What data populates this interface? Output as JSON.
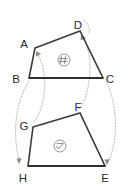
{
  "diagram": {
    "kind": "geometry-transformation-diagram",
    "background_color": "#ffffff",
    "stroke_color": "#3a3a3a",
    "arrow_color": "#b9b4ad",
    "label_color": "#2b2b2b",
    "marker_color": "#8a8a8a"
  },
  "shapes": [
    {
      "id": "upper-quadrilateral",
      "name": "ABCD",
      "vertex_order": [
        "A",
        "D",
        "C",
        "B"
      ],
      "marker": {
        "glyph": "hash-mark",
        "cx": 64,
        "cy": 60,
        "r": 6
      },
      "vertices": [
        {
          "label": "A",
          "x": 35,
          "y": 48,
          "label_x": 24,
          "label_y": 44
        },
        {
          "label": "D",
          "x": 80,
          "y": 31,
          "label_x": 76,
          "label_y": 25
        },
        {
          "label": "C",
          "x": 103,
          "y": 78,
          "label_x": 107,
          "label_y": 83
        },
        {
          "label": "B",
          "x": 29,
          "y": 78,
          "label_x": 14,
          "label_y": 81
        }
      ]
    },
    {
      "id": "lower-quadrilateral",
      "name": "GFEH",
      "vertex_order": [
        "G",
        "F",
        "E",
        "H"
      ],
      "marker": {
        "glyph": "check-mark",
        "cx": 60,
        "cy": 146,
        "r": 6
      },
      "vertices": [
        {
          "label": "G",
          "x": 33,
          "y": 127,
          "label_x": 20,
          "label_y": 126
        },
        {
          "label": "F",
          "x": 80,
          "y": 113,
          "label_x": 76,
          "label_y": 108
        },
        {
          "label": "E",
          "x": 105,
          "y": 166,
          "label_x": 102,
          "label_y": 180
        },
        {
          "label": "H",
          "x": 28,
          "y": 166,
          "label_x": 19,
          "label_y": 180
        }
      ]
    }
  ],
  "mapping_arrows": [
    {
      "id": "arrow-g-to-a",
      "from": "G",
      "to": "A",
      "direction": "up"
    },
    {
      "id": "arrow-f-to-d",
      "from": "F",
      "to": "D",
      "direction": "up"
    },
    {
      "id": "arrow-b-to-h",
      "from": "B",
      "to": "H",
      "direction": "down"
    },
    {
      "id": "arrow-c-to-e",
      "from": "C",
      "to": "E",
      "direction": "down"
    }
  ],
  "labels": {
    "A": "A",
    "B": "B",
    "C": "C",
    "D": "D",
    "E": "E",
    "F": "F",
    "G": "G",
    "H": "H"
  }
}
